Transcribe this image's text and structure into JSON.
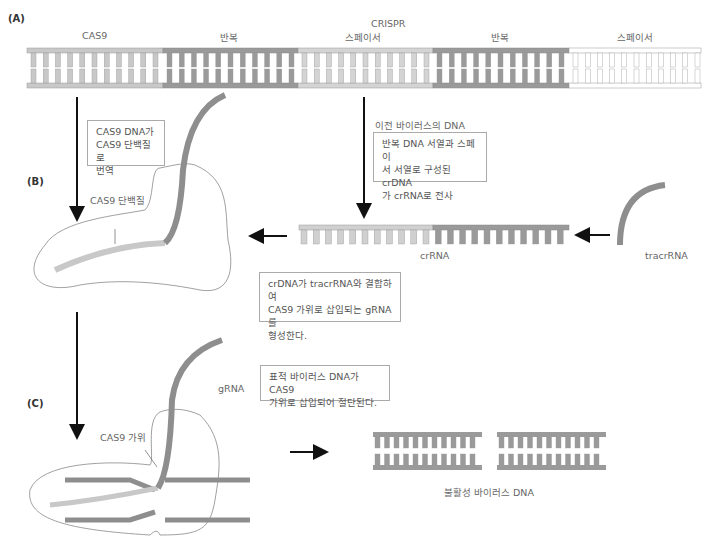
{
  "panels": {
    "a": "(A)",
    "b": "(B)",
    "c": "(C)"
  },
  "top_strand": {
    "title": "CRISPR",
    "segments": [
      {
        "label": "CAS9",
        "color": "#c8c8c8"
      },
      {
        "label": "반복",
        "color": "#9a9a9a"
      },
      {
        "label": "스페이서",
        "color": "#d4d4d4"
      },
      {
        "label": "반복",
        "color": "#9a9a9a"
      },
      {
        "label": "스페이서",
        "color": "#ffffff"
      }
    ]
  },
  "labels": {
    "cas9_protein": "CAS9 단백질",
    "prior_virus_dna": "이전 바이러스의 DNA",
    "crrna": "crRNA",
    "tracrrna": "tracrRNA",
    "grna": "gRNA",
    "cas9_scissors": "CAS9 가위",
    "inactive_dna": "불활성 바이러스 DNA"
  },
  "boxes": {
    "translation": [
      "CAS9 DNA가",
      "CAS9 단백질로",
      "번역"
    ],
    "transcription": [
      "반복 DNA 서열과 스페이",
      "서 서열로 구성된 crDNA",
      "가 crRNA로 전사"
    ],
    "binding": [
      "crDNA가 tracrRNA와 결합하여",
      "CAS9 가위로 삽입되는 gRNA를",
      "형성한다."
    ],
    "cleavage": [
      "표적 바이러스 DNA가 CAS9",
      "가위로 삽입되어 절단된다."
    ]
  },
  "colors": {
    "light_gray": "#c8c8c8",
    "dark_gray": "#9a9a9a",
    "outline": "#888888",
    "arrow": "#111111"
  }
}
